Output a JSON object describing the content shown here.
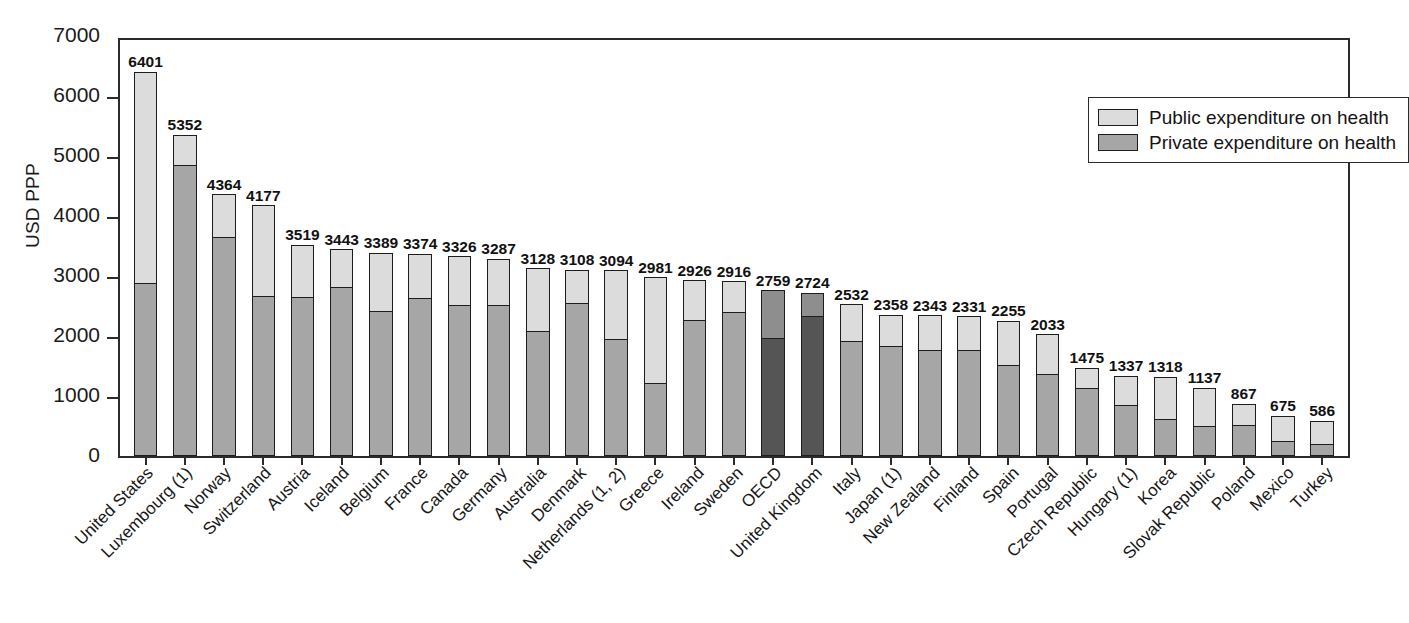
{
  "chart_data": {
    "type": "bar",
    "subtype": "stacked-bar",
    "title": "",
    "xlabel": "",
    "ylabel": "USD PPP",
    "ylim": [
      0,
      7000
    ],
    "yticks": [
      0,
      1000,
      2000,
      3000,
      4000,
      5000,
      6000,
      7000
    ],
    "ytick_labels": [
      "0",
      "1000",
      "2000",
      "3000",
      "4000",
      "5000",
      "6000",
      "7000"
    ],
    "grid": false,
    "legend_position": "top-right",
    "legend": [
      "Public expenditure on health",
      "Private expenditure on health"
    ],
    "categories": [
      "United States",
      "Luxembourg (1)",
      "Norway",
      "Switzerland",
      "Austria",
      "Iceland",
      "Belgium",
      "France",
      "Canada",
      "Germany",
      "Australia",
      "Denmark",
      "Netherlands (1, 2)",
      "Greece",
      "Ireland",
      "Sweden",
      "OECD",
      "United Kingdom",
      "Italy",
      "Japan (1)",
      "New Zealand",
      "Finland",
      "Spain",
      "Portugal",
      "Czech Republic",
      "Hungary (1)",
      "Korea",
      "Slovak Republic",
      "Poland",
      "Mexico",
      "Turkey"
    ],
    "totals": [
      6401,
      5352,
      4364,
      4177,
      3519,
      3443,
      3389,
      3374,
      3326,
      3287,
      3128,
      3108,
      3094,
      2981,
      2926,
      2916,
      2759,
      2724,
      2532,
      2358,
      2343,
      2331,
      2255,
      2033,
      1475,
      1337,
      1318,
      1137,
      867,
      675,
      586
    ],
    "series": [
      {
        "name": "Public expenditure on health",
        "values": [
          3520,
          482,
          699,
          1512,
          858,
          614,
          962,
          723,
          800,
          758,
          1035,
          548,
          1139,
          1772,
          644,
          504,
          790,
          374,
          600,
          518,
          563,
          551,
          730,
          655,
          330,
          487,
          710,
          632,
          345,
          428,
          398
        ]
      },
      {
        "name": "Private expenditure on health",
        "values": [
          2881,
          4870,
          3665,
          2665,
          2661,
          2829,
          2427,
          2651,
          2526,
          2529,
          2093,
          2560,
          1955,
          1209,
          2282,
          2412,
          1969,
          2350,
          1932,
          1840,
          1780,
          1780,
          1525,
          1378,
          1145,
          850,
          608,
          505,
          522,
          247,
          188
        ]
      }
    ],
    "highlighted_categories": [
      "OECD",
      "United Kingdom"
    ],
    "colors": {
      "public": "#dcdcdc",
      "private": "#a6a6a6",
      "highlight_public": "#8e8e8e",
      "highlight_private": "#555555",
      "outline": "#1d1d1d",
      "axis": "#2b2b2b",
      "background": "#ffffff",
      "text": "#1a1a1a"
    }
  },
  "axis": {
    "y_title": "USD PPP"
  },
  "legend": {
    "items": [
      {
        "label": "Public expenditure on health",
        "swatch": "public"
      },
      {
        "label": "Private expenditure on health",
        "swatch": "private"
      }
    ]
  }
}
